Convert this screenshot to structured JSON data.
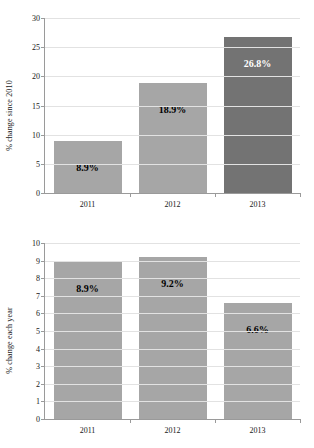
{
  "figure": {
    "clipped_top_text": "",
    "bar_color": "#a6a6a6",
    "bar_color_highlight": "#737373",
    "grid_color": "#e2e2e2",
    "axis_color": "#9a9a9a"
  },
  "chart_data": [
    {
      "type": "bar",
      "id": "cumulative-change",
      "title": "",
      "xlabel": "",
      "ylabel": "% change since 2010",
      "categories": [
        "2011",
        "2012",
        "2013"
      ],
      "values": [
        8.9,
        18.9,
        26.8
      ],
      "data_labels": [
        "8.9%",
        "18.9%",
        "26.8%"
      ],
      "bar_colors": [
        "#a6a6a6",
        "#a6a6a6",
        "#737373"
      ],
      "label_colors": [
        "#000000",
        "#000000",
        "#ffffff"
      ],
      "ylim": [
        0,
        30
      ],
      "yticks": [
        0,
        5,
        10,
        15,
        20,
        25,
        30
      ],
      "ytick_labels": [
        "0",
        "5",
        "10",
        "15",
        "20",
        "25",
        "30"
      ],
      "grid": true,
      "legend": "none"
    },
    {
      "type": "bar",
      "id": "annual-change",
      "title": "",
      "xlabel": "",
      "ylabel": "% change each year",
      "categories": [
        "2011",
        "2012",
        "2013"
      ],
      "values": [
        8.9,
        9.2,
        6.6
      ],
      "data_labels": [
        "8.9%",
        "9.2%",
        "6.6%"
      ],
      "bar_colors": [
        "#a6a6a6",
        "#a6a6a6",
        "#a6a6a6"
      ],
      "label_colors": [
        "#000000",
        "#000000",
        "#000000"
      ],
      "ylim": [
        0,
        10
      ],
      "yticks": [
        0,
        1,
        2,
        3,
        4,
        5,
        6,
        7,
        8,
        9,
        10
      ],
      "ytick_labels": [
        "0",
        "1",
        "2",
        "3",
        "4",
        "5",
        "6",
        "7",
        "8",
        "9",
        "10"
      ],
      "grid": true,
      "legend": "none"
    }
  ]
}
